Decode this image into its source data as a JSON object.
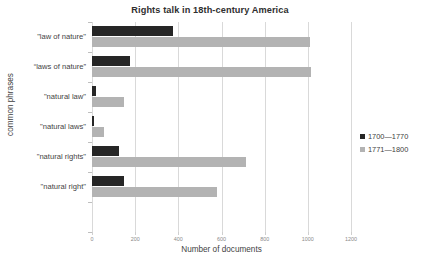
{
  "chart_data": {
    "type": "bar",
    "orientation": "horizontal",
    "title": "Rights talk in 18th-century America",
    "xlabel": "Number of documents",
    "ylabel": "common phrases",
    "categories": [
      "\"law of nature\"",
      "“laws of nature”",
      "\"natural law\"",
      "\"natural laws\"",
      "\"natural rights\"",
      "\"natural right\""
    ],
    "series": [
      {
        "name": "1700—1770",
        "color": "#262626",
        "values": [
          375,
          175,
          20,
          8,
          125,
          150
        ]
      },
      {
        "name": "1771—1800",
        "color": "#b3b3b3",
        "values": [
          1010,
          1015,
          150,
          55,
          715,
          580
        ]
      }
    ],
    "xlim": [
      0,
      1200
    ],
    "xticks": [
      0,
      200,
      400,
      600,
      800,
      1000,
      1200
    ],
    "xtick_labels": [
      "0",
      "200",
      "400",
      "600",
      "800",
      "1000",
      "1200"
    ],
    "grid": "vertical",
    "legend_position": "right"
  },
  "colors": {
    "background": "#ffffff",
    "gridline": "#d9d9d9",
    "axis": "#bfbfbf",
    "text": "#3f3f3f",
    "title": "#2f2f2f",
    "tick_text": "#8a8a8a"
  }
}
